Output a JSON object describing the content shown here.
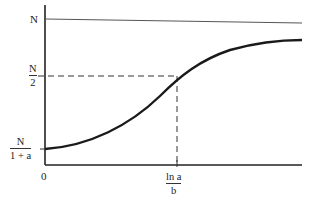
{
  "diagram": {
    "type": "logistic-growth-curve",
    "labels": {
      "y_top": "N",
      "y_half_num": "N",
      "y_half_den": "2",
      "y_start_num": "N",
      "y_start_den": "1 + a",
      "x_origin": "0",
      "x_inflection_num": "ln a",
      "x_inflection_den": "b"
    },
    "colors": {
      "axis": "#222222",
      "curve": "#1a1a1a",
      "asymptote": "#555555",
      "dashed": "#333333"
    }
  }
}
